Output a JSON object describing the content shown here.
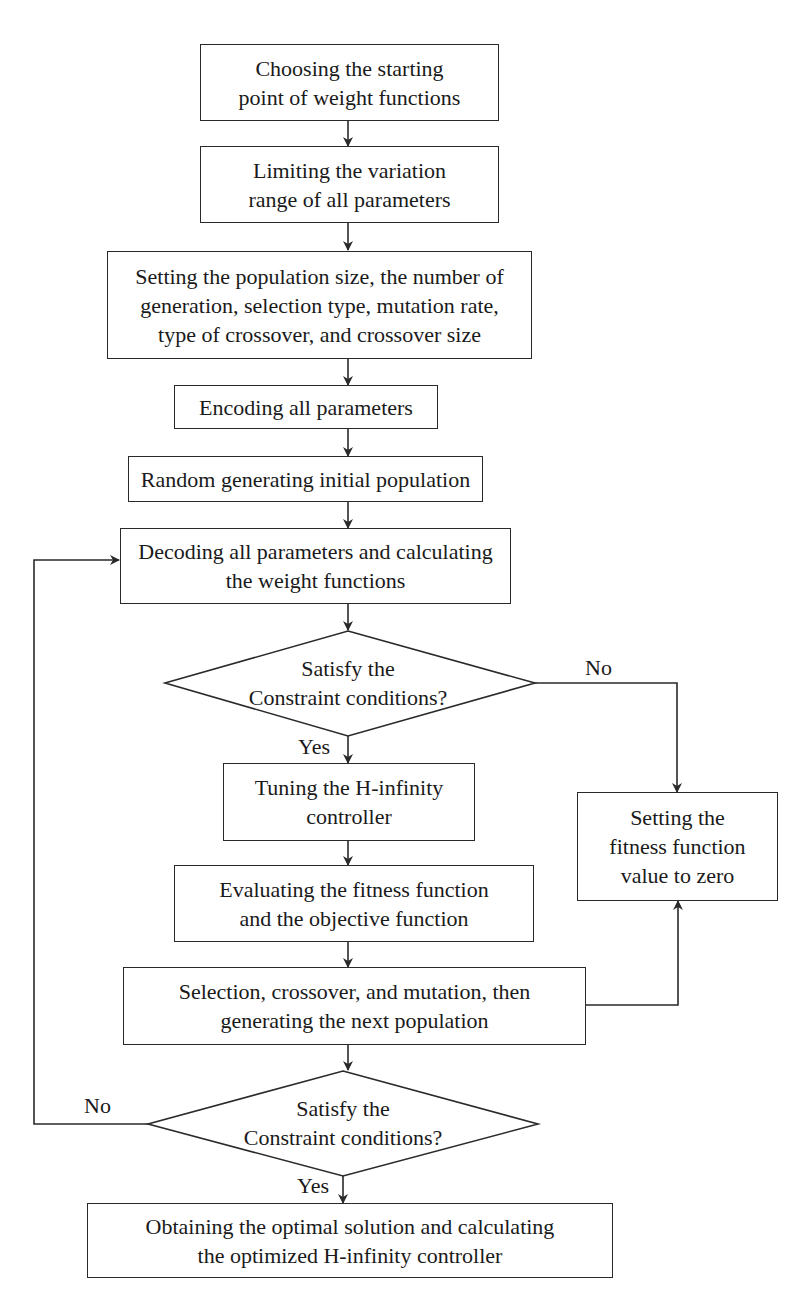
{
  "flowchart": {
    "steps": {
      "choose_start": {
        "lines": [
          "Choosing the starting",
          "point of weight functions"
        ]
      },
      "limit_range": {
        "lines": [
          "Limiting the variation",
          "range of all parameters"
        ]
      },
      "set_params": {
        "lines": [
          "Setting the population size, the number of",
          "generation, selection type, mutation rate,",
          "type of crossover, and crossover size"
        ]
      },
      "encode": {
        "lines": [
          "Encoding all parameters"
        ]
      },
      "random_init": {
        "lines": [
          "Random generating initial population"
        ]
      },
      "decode": {
        "lines": [
          "Decoding all parameters and calculating",
          "the weight functions"
        ]
      },
      "decision1": {
        "lines": [
          "Satisfy the",
          "Constraint conditions?"
        ]
      },
      "tune": {
        "lines": [
          "Tuning the H-infinity",
          "controller"
        ]
      },
      "set_zero": {
        "lines": [
          "Setting the",
          "fitness function",
          "value to zero"
        ]
      },
      "evaluate": {
        "lines": [
          "Evaluating the fitness function",
          "and the objective function"
        ]
      },
      "selection": {
        "lines": [
          "Selection, crossover, and mutation, then",
          "generating the next population"
        ]
      },
      "decision2": {
        "lines": [
          "Satisfy the",
          "Constraint conditions?"
        ]
      },
      "final": {
        "lines": [
          "Obtaining the optimal solution and calculating",
          "the optimized H-infinity controller"
        ]
      }
    },
    "edge_labels": {
      "d1_no": "No",
      "d1_yes": "Yes",
      "d2_no": "No",
      "d2_yes": "Yes"
    },
    "colors": {
      "stroke": "#2a2a2a",
      "background": "#ffffff",
      "text": "#1a1a1a"
    }
  }
}
